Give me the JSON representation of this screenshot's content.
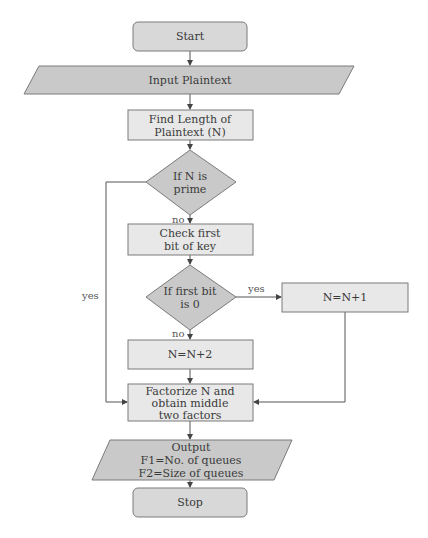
{
  "diagram": {
    "type": "flowchart",
    "colors": {
      "terminal_fill": "#d8d8d8",
      "process_fill": "#e8e8e8",
      "decision_fill": "#c9c9c9",
      "io_fill": "#c9c9c9",
      "stroke": "#7a7a7a",
      "edge": "#555555"
    },
    "nodes": {
      "start": {
        "shape": "terminal",
        "lines": [
          "Start"
        ]
      },
      "input": {
        "shape": "io",
        "lines": [
          "Input Plaintext"
        ]
      },
      "find_length": {
        "shape": "process",
        "lines": [
          "Find Length of",
          "Plaintext (N)"
        ]
      },
      "is_prime": {
        "shape": "decision",
        "lines": [
          "If N is",
          "prime"
        ]
      },
      "check_bit": {
        "shape": "process",
        "lines": [
          "Check first",
          "bit of key"
        ]
      },
      "first_bit_zero": {
        "shape": "decision",
        "lines": [
          "If first bit",
          "is 0"
        ]
      },
      "n_plus_1": {
        "shape": "process",
        "lines": [
          "N=N+1"
        ]
      },
      "n_plus_2": {
        "shape": "process",
        "lines": [
          "N=N+2"
        ]
      },
      "factorize": {
        "shape": "process",
        "lines": [
          "Factorize N and",
          "obtain middle",
          "two factors"
        ]
      },
      "output": {
        "shape": "io",
        "lines": [
          "Output",
          "F1=No. of queues",
          "F2=Size of queues"
        ]
      },
      "stop": {
        "shape": "terminal",
        "lines": [
          "Stop"
        ]
      }
    },
    "edges": [
      {
        "from": "start",
        "to": "input",
        "label": ""
      },
      {
        "from": "input",
        "to": "find_length",
        "label": ""
      },
      {
        "from": "find_length",
        "to": "is_prime",
        "label": ""
      },
      {
        "from": "is_prime",
        "to": "check_bit",
        "label": "no"
      },
      {
        "from": "is_prime",
        "to": "factorize",
        "label": "yes"
      },
      {
        "from": "check_bit",
        "to": "first_bit_zero",
        "label": ""
      },
      {
        "from": "first_bit_zero",
        "to": "n_plus_1",
        "label": "yes"
      },
      {
        "from": "first_bit_zero",
        "to": "n_plus_2",
        "label": "no"
      },
      {
        "from": "n_plus_1",
        "to": "factorize",
        "label": ""
      },
      {
        "from": "n_plus_2",
        "to": "factorize",
        "label": ""
      },
      {
        "from": "factorize",
        "to": "output",
        "label": ""
      },
      {
        "from": "output",
        "to": "stop",
        "label": ""
      }
    ],
    "labels": {
      "prime_no": "no",
      "prime_yes": "yes",
      "bit_yes": "yes",
      "bit_no": "no"
    }
  }
}
